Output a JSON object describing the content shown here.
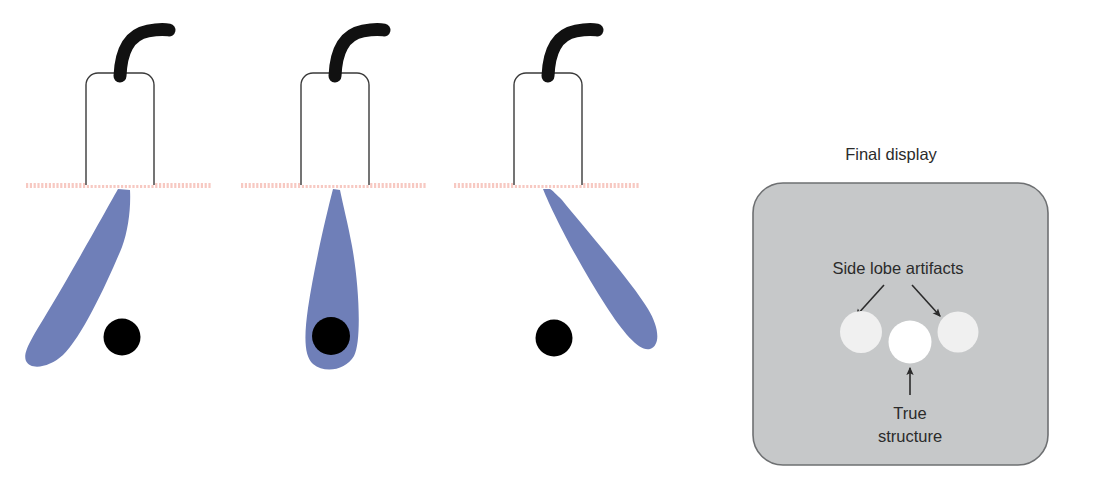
{
  "figure": {
    "title_visible": false,
    "background_color": "#ffffff",
    "panel_count": 4
  },
  "colors": {
    "beam": "#6f7fb8",
    "beam_edge": "#6f7fb8",
    "target_structure": "#000000",
    "probe_outline": "#3a3a3a",
    "probe_fill": "#ffffff",
    "cable": "#111111",
    "skin_line": "#f7c9c2",
    "display_background": "#c6c8c9",
    "display_border": "#6e7072",
    "side_lobe_spot": "#f0f0f0",
    "true_structure_spot": "#ffffff",
    "arrow": "#2b2b2b",
    "text": "#2b2b2b"
  },
  "scan_panels": [
    {
      "name": "beam-left-of-structure",
      "probe_label": "ultrasound-transducer",
      "beam_direction": "angled-left",
      "structure_inside_beam": false,
      "skin_line_label": "skin-surface"
    },
    {
      "name": "beam-on-structure",
      "probe_label": "ultrasound-transducer",
      "beam_direction": "straight-down",
      "structure_inside_beam": true,
      "skin_line_label": "skin-surface"
    },
    {
      "name": "beam-right-of-structure",
      "probe_label": "ultrasound-transducer",
      "beam_direction": "angled-right",
      "structure_inside_beam": false,
      "skin_line_label": "skin-surface"
    }
  ],
  "display": {
    "title": "Final display",
    "side_lobe_label": "Side lobe artifacts",
    "true_structure_label_line1": "True",
    "true_structure_label_line2": "structure",
    "spots": [
      {
        "name": "side-lobe-left",
        "kind": "artifact"
      },
      {
        "name": "true-structure",
        "kind": "true"
      },
      {
        "name": "side-lobe-right",
        "kind": "artifact"
      }
    ],
    "arrows": [
      {
        "name": "arrow-to-left-side-lobe"
      },
      {
        "name": "arrow-to-right-side-lobe"
      },
      {
        "name": "arrow-to-true-structure"
      }
    ]
  }
}
